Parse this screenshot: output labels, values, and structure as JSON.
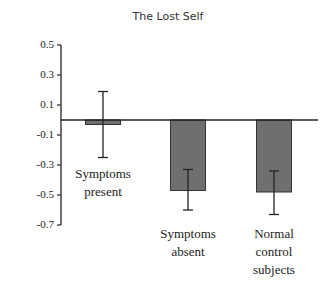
{
  "chart_data": {
    "type": "bar",
    "title": "The Lost Self",
    "xlabel": "",
    "ylabel": "",
    "ylim": [
      -0.7,
      0.5
    ],
    "yticks": [
      "0.5",
      "0.3",
      "0.1",
      "-0.1",
      "-0.3",
      "-0.5",
      "-0.7"
    ],
    "categories": [
      "Symptoms present",
      "Symptoms absent",
      "Normal control subjects"
    ],
    "category_lines": [
      [
        "Symptoms",
        "present"
      ],
      [
        "Symptoms",
        "absent"
      ],
      [
        "Normal",
        "control",
        "subjects"
      ]
    ],
    "values": [
      -0.03,
      -0.47,
      -0.48
    ],
    "error_bars": [
      {
        "upper": 0.19,
        "lower": -0.25
      },
      {
        "upper": -0.33,
        "lower": -0.6
      },
      {
        "upper": -0.34,
        "lower": -0.63
      }
    ],
    "bar_color": "#6f6f6f",
    "grid": false,
    "legend": null
  }
}
